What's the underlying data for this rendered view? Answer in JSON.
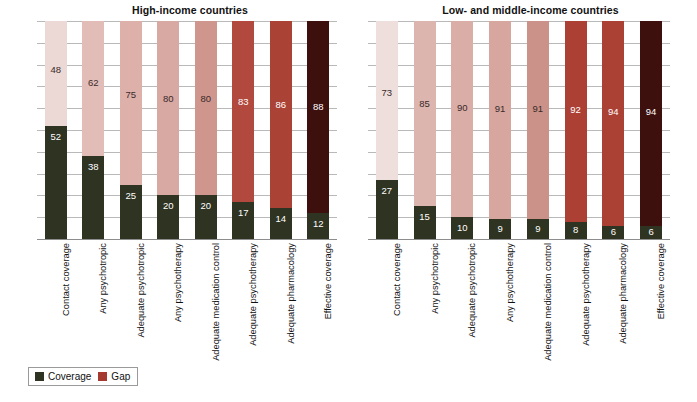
{
  "chart_data": {
    "type": "bar",
    "subtype": "stacked-100-percent",
    "title": "",
    "xlabel": "",
    "ylabel": "",
    "ylim": [
      0,
      100
    ],
    "ytick_labels": [
      "100",
      "90",
      "80",
      "70",
      "60",
      "50",
      "40",
      "30",
      "20",
      "10",
      "0"
    ],
    "ytick_values": [
      100,
      90,
      80,
      70,
      60,
      50,
      40,
      30,
      20,
      10,
      0
    ],
    "grid": true,
    "legend": {
      "position": "bottom-left",
      "entries": [
        {
          "label": "Coverage",
          "color": "#2e3322"
        },
        {
          "label": "Gap",
          "color": "#a6392f"
        }
      ]
    },
    "categories": [
      "Contact coverage",
      "Any psychotropic",
      "Adequate psychotropic",
      "Any psychotherapy",
      "Adequate medication control",
      "Adequate psychotherapy",
      "Adequate  pharmacology",
      "Effective coverage"
    ],
    "panels": [
      {
        "title": "High-income countries",
        "series": [
          {
            "name": "Coverage",
            "values": [
              52,
              38,
              25,
              20,
              20,
              17,
              14,
              12
            ]
          },
          {
            "name": "Gap",
            "values": [
              48,
              62,
              75,
              80,
              80,
              83,
              86,
              88
            ]
          }
        ],
        "gap_colors": [
          "#ecd9d6",
          "#e2bdb8",
          "#ddb0aa",
          "#d8a8a2",
          "#cf968e",
          "#b2493e",
          "#ab4236",
          "#3d100e"
        ],
        "gap_label_styles": [
          "dark",
          "dark",
          "dark",
          "dark",
          "dark",
          "light",
          "light",
          "light"
        ],
        "coverage_color": "#2e3322"
      },
      {
        "title": "Low- and middle-income countries",
        "series": [
          {
            "name": "Coverage",
            "values": [
              27,
              15,
              10,
              9,
              9,
              8,
              6,
              6
            ]
          },
          {
            "name": "Gap",
            "values": [
              73,
              85,
              90,
              91,
              91,
              92,
              94,
              94
            ]
          }
        ],
        "gap_colors": [
          "#eedfdc",
          "#ddb5af",
          "#dbada7",
          "#d7a69f",
          "#cb9289",
          "#ac4034",
          "#ab4135",
          "#3d100e"
        ],
        "gap_label_styles": [
          "dark",
          "dark",
          "dark",
          "dark",
          "dark",
          "light",
          "light",
          "light"
        ],
        "coverage_color": "#2e3322"
      }
    ]
  }
}
